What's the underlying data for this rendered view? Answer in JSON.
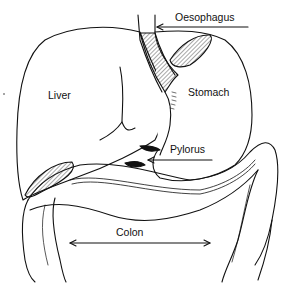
{
  "diagram": {
    "type": "anatomy",
    "labels": {
      "oesophagus": "Oesophagus",
      "liver": "Liver",
      "stomach": "Stomach",
      "pylorus": "Pylorus",
      "colon": "Colon"
    },
    "line_color": "#111111",
    "background": "#ffffff"
  }
}
